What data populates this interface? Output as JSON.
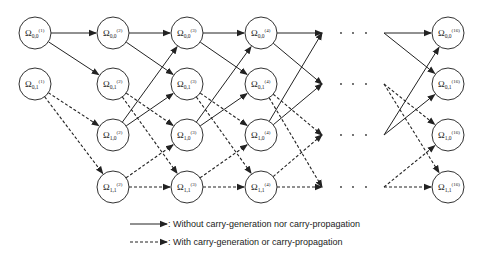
{
  "diagram": {
    "node_symbol": "Ω",
    "columns": [
      {
        "stage": "(1)",
        "x": 35,
        "nodes": [
          {
            "sub": "0,0",
            "y": 33
          },
          {
            "sub": "0,1",
            "y": 84
          }
        ]
      },
      {
        "stage": "(2)",
        "x": 113,
        "nodes": [
          {
            "sub": "0,0",
            "y": 33
          },
          {
            "sub": "0,1",
            "y": 84
          },
          {
            "sub": "1,0",
            "y": 135
          },
          {
            "sub": "1,1",
            "y": 187
          }
        ]
      },
      {
        "stage": "(3)",
        "x": 187,
        "nodes": [
          {
            "sub": "0,0",
            "y": 33
          },
          {
            "sub": "0,1",
            "y": 84
          },
          {
            "sub": "1,0",
            "y": 135
          },
          {
            "sub": "1,1",
            "y": 187
          }
        ]
      },
      {
        "stage": "(4)",
        "x": 261,
        "nodes": [
          {
            "sub": "0,0",
            "y": 33
          },
          {
            "sub": "0,1",
            "y": 84
          },
          {
            "sub": "1,0",
            "y": 135
          },
          {
            "sub": "1,1",
            "y": 187
          }
        ]
      },
      {
        "stage": "(16)",
        "x": 448,
        "nodes": [
          {
            "sub": "0,0",
            "y": 33
          },
          {
            "sub": "0,1",
            "y": 84
          },
          {
            "sub": "1,0",
            "y": 135
          },
          {
            "sub": "1,1",
            "y": 187
          }
        ]
      }
    ],
    "ellipsis": "· · ·",
    "legend": {
      "solid_label": ": Without carry-generation nor carry-propagation",
      "dashed_label": ": With carry-generation or carry-propagation"
    }
  }
}
